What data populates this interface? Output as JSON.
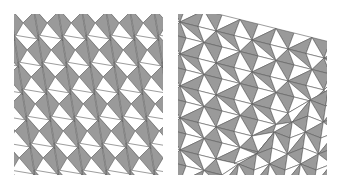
{
  "figure": {
    "panels": [
      {
        "id": "left",
        "description": "periodic tiling of gray and white triangles forming zigzag arrow-like columns",
        "colors": {
          "fill": "#9a9a9a",
          "background": "#ffffff",
          "stroke": "#5a5a5a"
        },
        "cell_width": 24,
        "cell_height": 27,
        "row_shift": 4
      },
      {
        "id": "right",
        "description": "distorted triangle mesh: diagonal bands in upper-left, vertical slivers in lower-right, separated by a crease",
        "colors": {
          "fill": "#9a9a9a",
          "background": "#ffffff",
          "stroke": "#5a5a5a"
        }
      }
    ]
  }
}
